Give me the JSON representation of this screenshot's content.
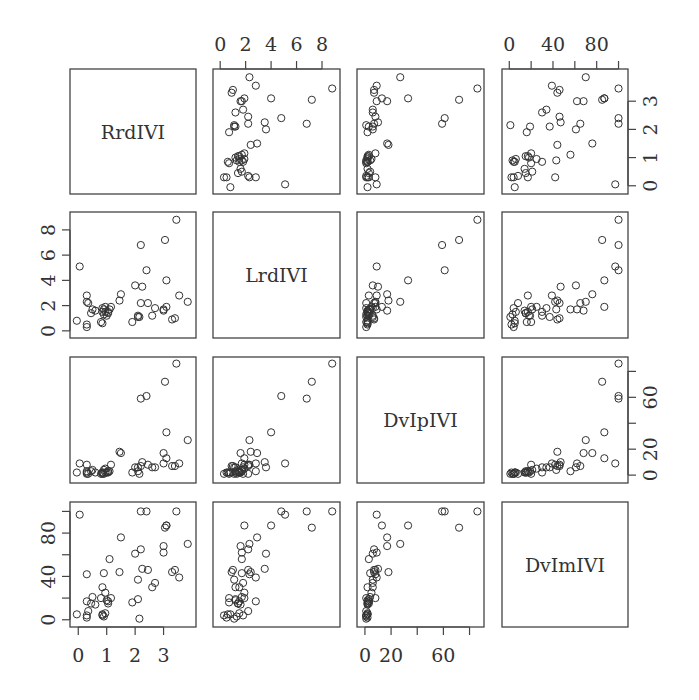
{
  "chart_data": {
    "type": "scatter",
    "subtype": "pairs-matrix",
    "title": "",
    "variables": [
      "RrdIVI",
      "LrdIVI",
      "DvIpIVI",
      "DvImIVI"
    ],
    "axes": {
      "RrdIVI": {
        "ticks": [
          0,
          1,
          2,
          3
        ],
        "range": [
          -0.15,
          4.0
        ]
      },
      "LrdIVI": {
        "ticks": [
          0,
          2,
          4,
          6,
          8
        ],
        "range": [
          -0.25,
          9.1
        ]
      },
      "DvIpIVI": {
        "ticks": [
          0,
          20,
          40,
          60,
          80
        ],
        "tick_labels": [
          "0",
          "20",
          "",
          "60",
          ""
        ],
        "range": [
          -3,
          88
        ]
      },
      "DvImIVI": {
        "ticks": [
          0,
          20,
          40,
          60,
          80,
          100
        ],
        "tick_labels": [
          "0",
          "",
          "40",
          "",
          "80",
          ""
        ],
        "range": [
          -3,
          105
        ]
      }
    },
    "tick_label_placement": {
      "top": {
        "col2": "LrdIVI",
        "col4": "DvImIVI"
      },
      "right": {
        "row1": "RrdIVI",
        "row3": "DvIpIVI"
      },
      "left": {
        "row2": "LrdIVI",
        "row4": "DvImIVI"
      },
      "bottom": {
        "col1": "RrdIVI",
        "col3": "DvIpIVI"
      }
    },
    "grid": false,
    "legend": null,
    "marker": "open-circle",
    "points": [
      {
        "R": 3.85,
        "L": 2.3,
        "P": 27,
        "M": 70
      },
      {
        "R": 3.45,
        "L": 8.8,
        "P": 86,
        "M": 100
      },
      {
        "R": 3.55,
        "L": 2.8,
        "P": 9,
        "M": 39
      },
      {
        "R": 3.05,
        "L": 7.2,
        "P": 72,
        "M": 85
      },
      {
        "R": 3.4,
        "L": 1.0,
        "P": 7,
        "M": 46
      },
      {
        "R": 3.3,
        "L": 0.9,
        "P": 7,
        "M": 44
      },
      {
        "R": 3.1,
        "L": 4.0,
        "P": 33,
        "M": 87
      },
      {
        "R": 3.1,
        "L": 1.9,
        "P": 13,
        "M": 87
      },
      {
        "R": 3.0,
        "L": 1.7,
        "P": 9,
        "M": 62
      },
      {
        "R": 3.0,
        "L": 1.6,
        "P": 17,
        "M": 68
      },
      {
        "R": 2.6,
        "L": 1.2,
        "P": 6,
        "M": 30
      },
      {
        "R": 2.7,
        "L": 1.8,
        "P": 6,
        "M": 34
      },
      {
        "R": 2.45,
        "L": 2.2,
        "P": 8,
        "M": 46
      },
      {
        "R": 2.4,
        "L": 4.8,
        "P": 61,
        "M": 100
      },
      {
        "R": 2.2,
        "L": 6.8,
        "P": 59,
        "M": 100
      },
      {
        "R": 2.2,
        "L": 2.2,
        "P": 7,
        "M": 65
      },
      {
        "R": 2.25,
        "L": 3.5,
        "P": 10,
        "M": 47
      },
      {
        "R": 2.0,
        "L": 3.6,
        "P": 6,
        "M": 61
      },
      {
        "R": 2.1,
        "L": 1.1,
        "P": 6,
        "M": 37
      },
      {
        "R": 2.1,
        "L": 1.2,
        "P": 3,
        "M": 19
      },
      {
        "R": 1.9,
        "L": 0.7,
        "P": 2,
        "M": 16
      },
      {
        "R": 2.15,
        "L": 1.1,
        "P": 1,
        "M": 1
      },
      {
        "R": 1.5,
        "L": 2.9,
        "P": 17,
        "M": 76
      },
      {
        "R": 1.45,
        "L": 2.4,
        "P": 18,
        "M": 44
      },
      {
        "R": 1.15,
        "L": 1.9,
        "P": 8,
        "M": 20
      },
      {
        "R": 1.1,
        "L": 1.7,
        "P": 3,
        "M": 56
      },
      {
        "R": 1.05,
        "L": 1.5,
        "P": 3,
        "M": 17
      },
      {
        "R": 1.05,
        "L": 1.4,
        "P": 2,
        "M": 15
      },
      {
        "R": 0.95,
        "L": 1.9,
        "P": 5,
        "M": 25
      },
      {
        "R": 0.9,
        "L": 1.7,
        "P": 4,
        "M": 43
      },
      {
        "R": 0.85,
        "L": 1.5,
        "P": 2,
        "M": 30
      },
      {
        "R": 0.8,
        "L": 0.7,
        "P": 1,
        "M": 20
      },
      {
        "R": 0.85,
        "L": 0.6,
        "P": 2,
        "M": 5
      },
      {
        "R": 0.9,
        "L": 1.3,
        "P": 1,
        "M": 3
      },
      {
        "R": 0.95,
        "L": 1.5,
        "P": 2,
        "M": 6
      },
      {
        "R": 0.85,
        "L": 1.8,
        "P": 1,
        "M": 4
      },
      {
        "R": 1.0,
        "L": 1.2,
        "P": 2,
        "M": 18
      },
      {
        "R": 0.6,
        "L": 1.6,
        "P": 2,
        "M": 14
      },
      {
        "R": 0.5,
        "L": 1.7,
        "P": 4,
        "M": 21
      },
      {
        "R": 0.45,
        "L": 1.4,
        "P": 3,
        "M": 15
      },
      {
        "R": 0.3,
        "L": 2.3,
        "P": 8,
        "M": 42
      },
      {
        "R": 0.3,
        "L": 2.8,
        "P": 3,
        "M": 17
      },
      {
        "R": 0.35,
        "L": 2.2,
        "P": 1,
        "M": 8
      },
      {
        "R": 0.3,
        "L": 0.3,
        "P": 1,
        "M": 4
      },
      {
        "R": 0.3,
        "L": 0.5,
        "P": 2,
        "M": 2
      },
      {
        "R": 0.05,
        "L": 5.1,
        "P": 9,
        "M": 97
      },
      {
        "R": -0.05,
        "L": 0.8,
        "P": 2,
        "M": 5
      }
    ]
  }
}
